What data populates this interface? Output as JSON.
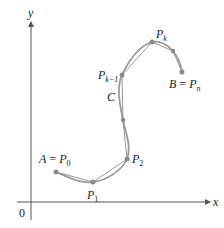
{
  "axes": {
    "x_label": "x",
    "y_label": "y",
    "origin_label": "0"
  },
  "curve": {
    "label": "C",
    "color": "#9a9a9a"
  },
  "points": [
    {
      "name": "A",
      "eq": " = ",
      "p": "P",
      "sub": "0"
    },
    {
      "p": "P",
      "sub": "1"
    },
    {
      "p": "P",
      "sub": "2"
    },
    {
      "p": "P",
      "sub": "k−1"
    },
    {
      "p": "P",
      "sub": "k"
    },
    {
      "name": "B",
      "eq": " = ",
      "p": "P",
      "sub": "n"
    }
  ],
  "colors": {
    "axis": "#555555",
    "curve": "#9a9a9a",
    "polygon": "#8c8c8c",
    "point": "#8a8a8a",
    "text": "#1a1a1a"
  }
}
